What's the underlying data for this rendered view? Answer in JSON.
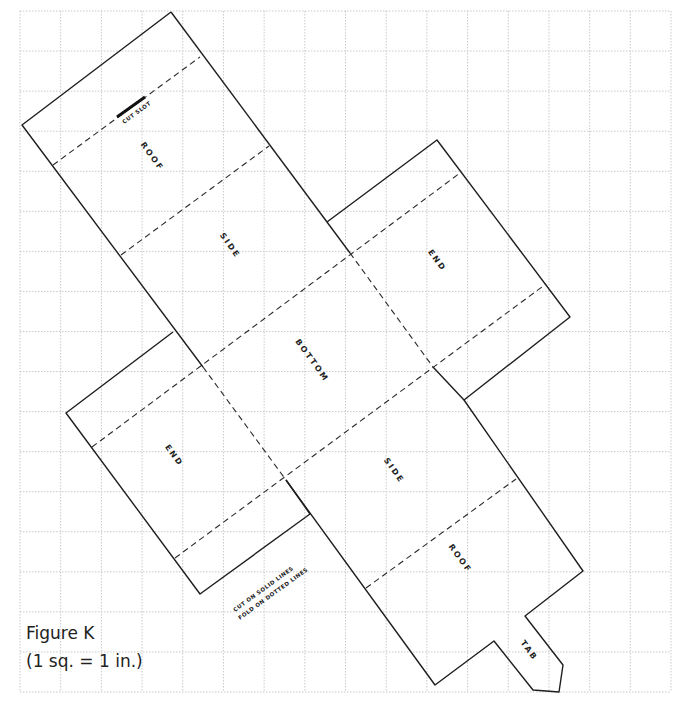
{
  "figure": {
    "title": "Figure K",
    "scale": "(1 sq. = 1 in.)"
  },
  "grid": {
    "x0": 20,
    "y0": 11,
    "x1": 671,
    "y1": 692,
    "cols": 16,
    "rows": 17,
    "color": "#c9c9c9"
  },
  "panels": [
    {
      "id": "roof-top",
      "label": "ROOF",
      "x": 150,
      "y": 158,
      "angle": 54
    },
    {
      "id": "side-top",
      "label": "SIDE",
      "x": 228,
      "y": 247,
      "angle": 54
    },
    {
      "id": "bottom",
      "label": "BOTTOM",
      "x": 310,
      "y": 362,
      "angle": 54
    },
    {
      "id": "end-right",
      "label": "END",
      "x": 435,
      "y": 262,
      "angle": 54
    },
    {
      "id": "end-left",
      "label": "END",
      "x": 172,
      "y": 457,
      "angle": 54
    },
    {
      "id": "side-bottom",
      "label": "SIDE",
      "x": 392,
      "y": 472,
      "angle": 54
    },
    {
      "id": "roof-bottom",
      "label": "ROOF",
      "x": 458,
      "y": 560,
      "angle": 54
    },
    {
      "id": "tab",
      "label": "TAB",
      "x": 527,
      "y": 652,
      "angle": 54
    }
  ],
  "notes": {
    "slot": "CUT SLOT",
    "cut_line": "CUT ON SOLID LINES",
    "fold_line": "FOLD ON DOTTED LINES"
  },
  "colors": {
    "line": "#1e1e1e",
    "grid": "#c9c9c9",
    "background": "#ffffff"
  }
}
